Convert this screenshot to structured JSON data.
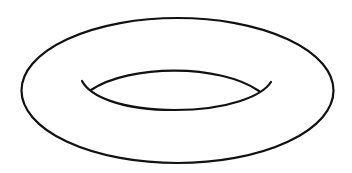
{
  "figure": {
    "stroke_color": "#111111",
    "background_color": "#ffffff",
    "stroke_width": 2.2,
    "outer_ellipse": {
      "cx": 177.5,
      "cy": 90.5,
      "rx": 156,
      "ry": 72.5
    },
    "inner_hole": {
      "upper_arc": "M 91 90 C 130 64, 220 64, 259 91",
      "lower_arc": "M 82 81 C 90 96, 120 110, 175 110 C 228 110, 262 96, 271 82"
    }
  }
}
